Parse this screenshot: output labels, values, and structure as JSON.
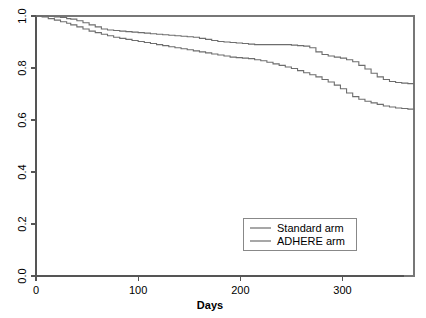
{
  "chart_data": {
    "type": "line",
    "title": "",
    "subtitle": "",
    "xlabel": "Days",
    "ylabel": "",
    "xlim": [
      0,
      370
    ],
    "ylim": [
      0.0,
      1.0
    ],
    "grid": false,
    "legend_position": "bottom-right",
    "xticks": [
      0,
      100,
      200,
      300
    ],
    "xtick_labels": [
      "0",
      "100",
      "200",
      "300"
    ],
    "yticks": [
      0.0,
      0.2,
      0.4,
      0.6,
      0.8,
      1.0
    ],
    "ytick_labels": [
      "0.0",
      "0.2",
      "0.4",
      "0.6",
      "0.8",
      "1.0"
    ],
    "series": [
      {
        "name": "Standard arm",
        "color": "#6d6d6d",
        "x": [
          0,
          6,
          12,
          18,
          24,
          30,
          34,
          40,
          46,
          52,
          58,
          64,
          70,
          76,
          82,
          88,
          94,
          100,
          106,
          112,
          118,
          124,
          130,
          136,
          142,
          148,
          154,
          160,
          166,
          172,
          178,
          184,
          190,
          196,
          202,
          208,
          214,
          220,
          226,
          232,
          238,
          244,
          250,
          256,
          262,
          268,
          274,
          280,
          286,
          292,
          298,
          304,
          310,
          316,
          322,
          328,
          334,
          340,
          346,
          352,
          358,
          364,
          370
        ],
        "y": [
          1.0,
          1.0,
          0.998,
          0.996,
          0.994,
          0.99,
          0.988,
          0.982,
          0.974,
          0.966,
          0.958,
          0.95,
          0.946,
          0.944,
          0.942,
          0.94,
          0.938,
          0.936,
          0.934,
          0.932,
          0.93,
          0.928,
          0.926,
          0.924,
          0.922,
          0.92,
          0.918,
          0.914,
          0.91,
          0.906,
          0.902,
          0.9,
          0.898,
          0.896,
          0.894,
          0.892,
          0.89,
          0.89,
          0.89,
          0.89,
          0.89,
          0.89,
          0.888,
          0.886,
          0.884,
          0.878,
          0.862,
          0.852,
          0.846,
          0.842,
          0.838,
          0.832,
          0.824,
          0.81,
          0.796,
          0.78,
          0.766,
          0.756,
          0.748,
          0.744,
          0.742,
          0.74,
          0.74
        ]
      },
      {
        "name": "ADHERE arm",
        "color": "#6d6d6d",
        "x": [
          0,
          6,
          12,
          18,
          24,
          30,
          34,
          40,
          46,
          52,
          58,
          64,
          70,
          76,
          82,
          88,
          94,
          100,
          106,
          112,
          118,
          124,
          130,
          136,
          142,
          148,
          154,
          160,
          166,
          172,
          178,
          184,
          190,
          196,
          202,
          208,
          214,
          220,
          226,
          232,
          238,
          244,
          250,
          256,
          262,
          268,
          274,
          280,
          286,
          292,
          298,
          304,
          310,
          316,
          322,
          328,
          334,
          340,
          346,
          352,
          358,
          364,
          370
        ],
        "y": [
          1.0,
          0.996,
          0.99,
          0.984,
          0.978,
          0.972,
          0.966,
          0.958,
          0.95,
          0.942,
          0.936,
          0.93,
          0.924,
          0.918,
          0.914,
          0.91,
          0.906,
          0.902,
          0.898,
          0.894,
          0.89,
          0.886,
          0.882,
          0.878,
          0.874,
          0.87,
          0.866,
          0.862,
          0.858,
          0.854,
          0.85,
          0.846,
          0.842,
          0.84,
          0.838,
          0.836,
          0.832,
          0.828,
          0.822,
          0.816,
          0.81,
          0.804,
          0.798,
          0.79,
          0.782,
          0.774,
          0.766,
          0.756,
          0.746,
          0.734,
          0.72,
          0.704,
          0.69,
          0.68,
          0.672,
          0.666,
          0.66,
          0.654,
          0.65,
          0.646,
          0.644,
          0.642,
          0.64
        ]
      }
    ],
    "legend": [
      "Standard arm",
      "ADHERE arm"
    ]
  }
}
